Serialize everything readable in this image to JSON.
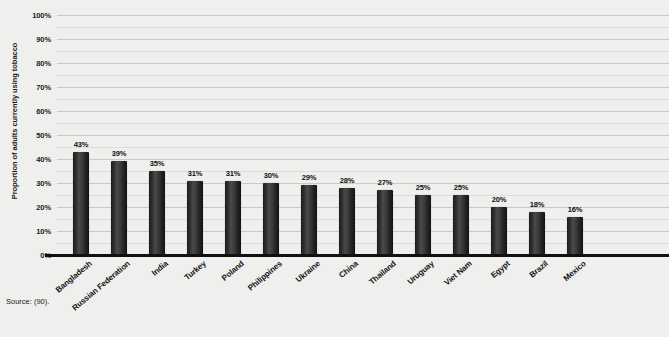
{
  "chart_data": {
    "type": "bar",
    "title": "",
    "xlabel": "",
    "ylabel": "Proportion of adults currently using tobacco",
    "ylim": [
      0,
      100
    ],
    "y_tick_labels": [
      "0%",
      "10%",
      "20%",
      "30%",
      "40%",
      "50%",
      "60%",
      "70%",
      "80%",
      "90%",
      "100%"
    ],
    "y_tick_values": [
      0,
      10,
      20,
      30,
      40,
      50,
      60,
      70,
      80,
      90,
      100
    ],
    "grid": "horizontal major at 10% with minor lines at 5%",
    "legend": "none",
    "bar_color": "#2b2b2b",
    "categories": [
      "Bangladesh",
      "Russian Federation",
      "India",
      "Turkey",
      "Poland",
      "Philippines",
      "Ukraine",
      "China",
      "Thailand",
      "Uruguay",
      "Viet Nam",
      "Egypt",
      "Brazil",
      "Mexico"
    ],
    "values": [
      43,
      39,
      35,
      31,
      31,
      30,
      29,
      28,
      27,
      25,
      25,
      20,
      18,
      16
    ],
    "data_labels": [
      "43%",
      "39%",
      "35%",
      "31%",
      "31%",
      "30%",
      "29%",
      "28%",
      "27%",
      "25%",
      "25%",
      "20%",
      "18%",
      "16%"
    ],
    "source": "Source: (90)."
  }
}
